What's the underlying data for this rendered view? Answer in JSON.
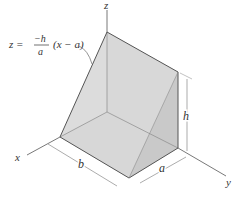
{
  "figure": {
    "type": "3d-wedge-diagram",
    "equation": {
      "lhs": "z =",
      "numerator": "−h",
      "denominator": "a",
      "factor": "(x − a)"
    },
    "axes": {
      "x": "x",
      "y": "y",
      "z": "z"
    },
    "dimensions": {
      "b": "b",
      "a": "a",
      "h": "h"
    },
    "colors": {
      "face_slant": "#d9d9d9",
      "face_back": "#e6e6e6",
      "face_side": "#c8c8c8",
      "face_bottom": "#dedede",
      "edge": "#555555",
      "axis": "#555555",
      "dim_line": "#888888"
    }
  }
}
